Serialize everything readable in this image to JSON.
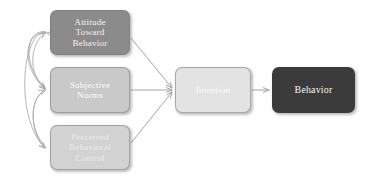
{
  "diagram": {
    "type": "flow-diagram",
    "background_color": "#ffffff",
    "nodes": [
      {
        "id": "attitude",
        "label": "Attitude\nToward\nBehavior",
        "fill": "#8b8b8b",
        "text_color": "#f2f2f2"
      },
      {
        "id": "subjective_norms",
        "label": "Subjective\nNorms",
        "fill": "#c9c9c9",
        "text_color": "#fcfcfc"
      },
      {
        "id": "perceived_behavioral_control",
        "label": "Perceived\nBehavioral\nControl",
        "fill": "#d2d2d2",
        "text_color": "#eaeaea"
      },
      {
        "id": "intention",
        "label": "Intention",
        "fill": "#e3e3e3",
        "text_color": "#fbfbfb"
      },
      {
        "id": "behavior",
        "label": "Behavior",
        "fill": "#3b3b3b",
        "text_color": "#f4f4f4"
      }
    ],
    "connectors": [
      {
        "id": "attitude-to-intention",
        "from": "attitude",
        "to": "intention",
        "style": "straight",
        "arrowheads": "single",
        "color": "#9a9a9a"
      },
      {
        "id": "subjective-norms-to-intention",
        "from": "subjective_norms",
        "to": "intention",
        "style": "straight",
        "arrowheads": "single",
        "color": "#9a9a9a"
      },
      {
        "id": "pbc-to-intention",
        "from": "perceived_behavioral_control",
        "to": "intention",
        "style": "straight",
        "arrowheads": "single",
        "color": "#9a9a9a"
      },
      {
        "id": "intention-to-behavior",
        "from": "intention",
        "to": "behavior",
        "style": "straight",
        "arrowheads": "single",
        "color": "#9a9a9a"
      },
      {
        "id": "attitude-subjective-norms-correlation",
        "from": "attitude",
        "to": "subjective_norms",
        "style": "curved",
        "arrowheads": "double",
        "color": "#a8a8a8"
      },
      {
        "id": "subjective-norms-pbc-correlation",
        "from": "subjective_norms",
        "to": "perceived_behavioral_control",
        "style": "curved",
        "arrowheads": "double",
        "color": "#a8a8a8"
      },
      {
        "id": "attitude-pbc-correlation",
        "from": "attitude",
        "to": "perceived_behavioral_control",
        "style": "curved",
        "arrowheads": "double",
        "color": "#a8a8a8"
      }
    ]
  }
}
